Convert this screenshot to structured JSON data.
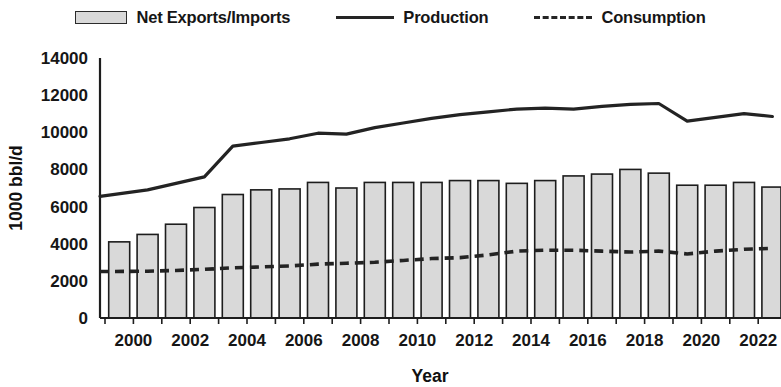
{
  "legend": {
    "position": "top-center",
    "items": [
      {
        "label": "Net Exports/Imports",
        "marker": "filled-bar-swatch",
        "color": "#d9d9d9"
      },
      {
        "label": "Production",
        "marker": "solid-line",
        "color": "#232323"
      },
      {
        "label": "Consumption",
        "marker": "dashed-line",
        "color": "#232323"
      }
    ]
  },
  "axes": {
    "y_title": "1000 bbl/d",
    "x_title": "Year",
    "y_ticks": [
      "0",
      "2000",
      "4000",
      "6000",
      "8000",
      "10000",
      "12000",
      "14000"
    ],
    "x_ticks": [
      "2000",
      "2002",
      "2004",
      "2006",
      "2008",
      "2010",
      "2012",
      "2014",
      "2016",
      "2018",
      "2020",
      "2022"
    ]
  },
  "chart_data": {
    "type": "bar",
    "title": "",
    "subtitle": "",
    "xlabel": "Year",
    "ylabel": "1000 bbl/d",
    "ylim": [
      0,
      14000
    ],
    "ytick_step": 2000,
    "grid": false,
    "legend_position": "top-center",
    "categories": [
      "2000",
      "2001",
      "2002",
      "2003",
      "2004",
      "2005",
      "2006",
      "2007",
      "2008",
      "2009",
      "2010",
      "2011",
      "2012",
      "2013",
      "2014",
      "2015",
      "2016",
      "2017",
      "2018",
      "2019",
      "2020",
      "2021",
      "2022",
      "2023"
    ],
    "series": [
      {
        "name": "Net Exports/Imports",
        "type": "bar",
        "values": [
          4100,
          4500,
          5050,
          5950,
          6650,
          6900,
          6950,
          7300,
          7000,
          7300,
          7300,
          7300,
          7400,
          7400,
          7250,
          7400,
          7650,
          7750,
          8000,
          7800,
          7150,
          7150,
          7300,
          7050
        ]
      },
      {
        "name": "Production",
        "type": "line",
        "values": [
          6550,
          6900,
          7250,
          7600,
          9250,
          9450,
          9650,
          9950,
          9900,
          10250,
          10500,
          10750,
          10950,
          11100,
          11250,
          11300,
          11250,
          11400,
          11500,
          11550,
          10600,
          10800,
          11000,
          10850
        ]
      },
      {
        "name": "Consumption",
        "type": "line",
        "values": [
          2500,
          2520,
          2560,
          2620,
          2700,
          2750,
          2800,
          2900,
          2950,
          3000,
          3100,
          3200,
          3250,
          3400,
          3600,
          3650,
          3650,
          3600,
          3550,
          3600,
          3450,
          3600,
          3700,
          3750
        ]
      }
    ]
  },
  "geometry": {
    "plot_left": 100,
    "plot_right": 781,
    "plot_top": 58,
    "plot_bottom": 318,
    "bar_pitch": 28.4,
    "bar_width": 21
  }
}
